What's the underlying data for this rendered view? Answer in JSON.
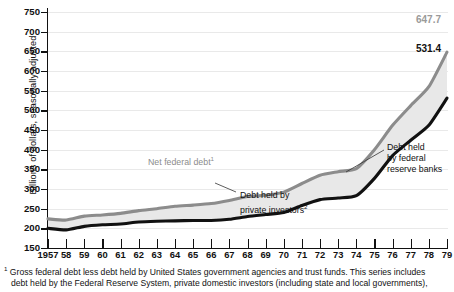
{
  "chart_data": {
    "type": "area",
    "title": "",
    "xlabel": "",
    "ylabel": "Billions of dollars, seasonally adjusted",
    "ylim": [
      150,
      750
    ],
    "ytick_values": [
      150,
      200,
      250,
      300,
      350,
      400,
      450,
      500,
      550,
      600,
      650,
      700,
      750
    ],
    "ytick_labels": [
      "150",
      "200",
      "250",
      "300",
      "350",
      "400",
      "450",
      "500",
      "550",
      "600",
      "650",
      "700",
      "750"
    ],
    "grid": false,
    "legend_position": "inline-annotations",
    "x": [
      1957,
      1958,
      1959,
      1960,
      1961,
      1962,
      1963,
      1964,
      1965,
      1966,
      1967,
      1968,
      1969,
      1970,
      1971,
      1972,
      1973,
      1974,
      1975,
      1976,
      1977,
      1978,
      1979
    ],
    "xtick_labels": [
      "1957",
      "58",
      "59",
      "60",
      "61",
      "62",
      "63",
      "64",
      "65",
      "66",
      "67",
      "68",
      "69",
      "70",
      "71",
      "72",
      "73",
      "74",
      "75",
      "76",
      "77",
      "78",
      "79"
    ],
    "series": [
      {
        "name": "Net federal debt",
        "color": "#8c8c8c",
        "values": [
          224,
          221,
          231,
          234,
          238,
          245,
          250,
          256,
          259,
          263,
          271,
          281,
          284,
          292,
          314,
          335,
          344,
          352,
          400,
          462,
          512,
          560,
          648
        ]
      },
      {
        "name": "Debt held by private investors",
        "color": "#111111",
        "values": [
          200,
          196,
          205,
          209,
          211,
          216,
          218,
          219,
          220,
          220,
          223,
          230,
          235,
          240,
          258,
          273,
          277,
          283,
          327,
          385,
          424,
          462,
          531
        ]
      }
    ],
    "band_fill": "#e8e8e8",
    "annotations": [
      {
        "name": "net-federal-debt",
        "text": "Net federal debt",
        "superscript": "1",
        "x": 1962,
        "y": 310,
        "color": "#8c8c8c"
      },
      {
        "name": "debt-held-private-investors",
        "text_line1": "Debt held by",
        "text_line2": "private investors",
        "superscript": "2",
        "x": 1968,
        "y": 236,
        "color": "#111111"
      },
      {
        "name": "debt-held-federal-reserve-banks",
        "text_line1": "Debt held",
        "text_line2": "by federal",
        "text_line3": "reserve banks",
        "x": 1977,
        "y": 400,
        "color": "#111111"
      }
    ],
    "endpoint_labels": [
      {
        "name": "net-federal-debt-endpoint",
        "value": "647.7",
        "color": "#9a9a9a"
      },
      {
        "name": "private-investors-endpoint",
        "value": "531.4",
        "color": "#111111"
      }
    ]
  },
  "axes": {
    "y_axis_title": "Billions of dollars, seasonally adjusted"
  },
  "footnote": {
    "marker": "1",
    "line1": "Gross federal debt less debt held by United States government agencies and trust funds.  This series includes",
    "line2": "debt held by the Federal Reserve System, private domestic investors (including state and local governments),"
  }
}
